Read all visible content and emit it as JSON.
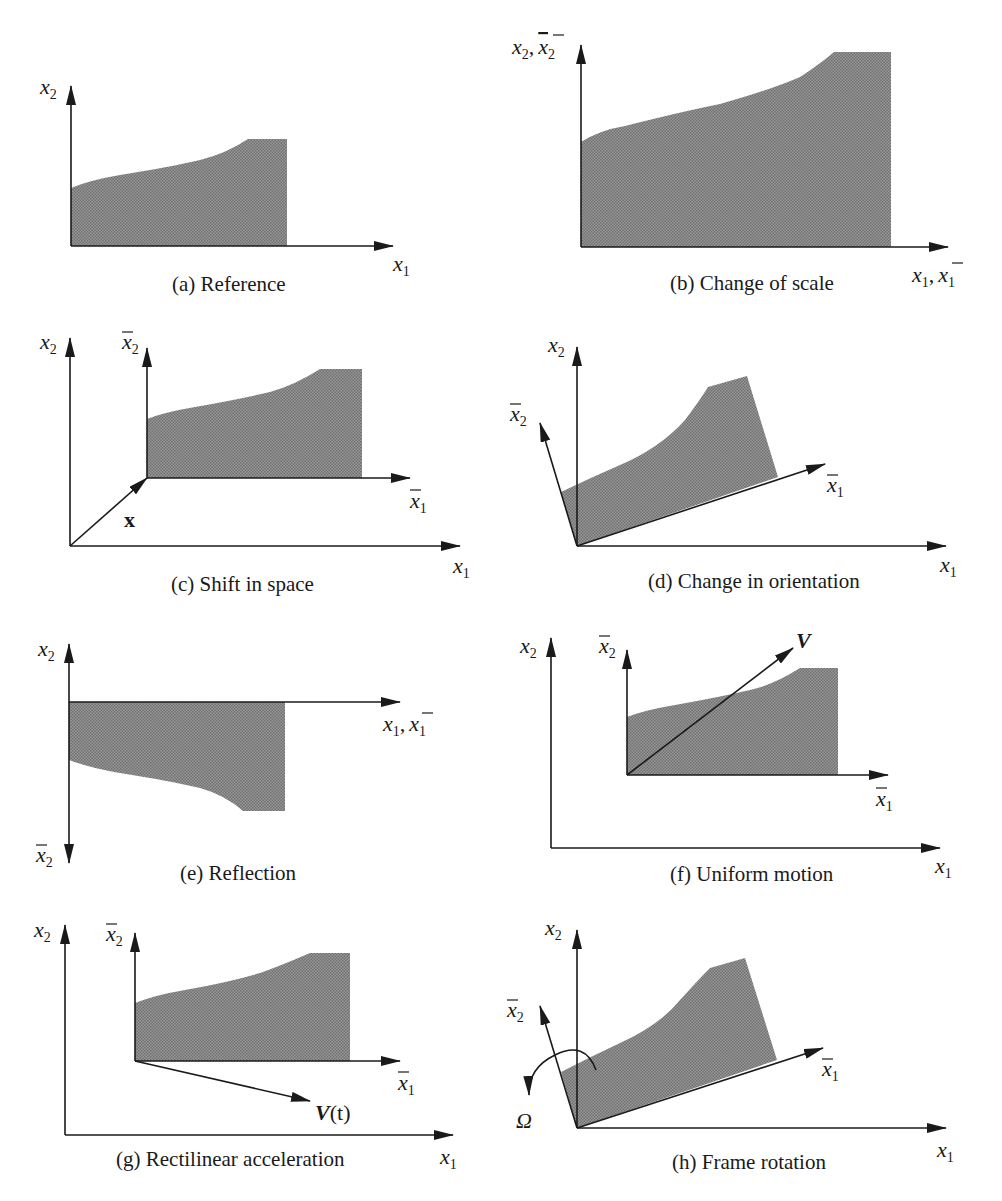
{
  "figure": {
    "colors": {
      "fill": "#8a8a8a",
      "ink": "#1a1a1a",
      "background": "#ffffff"
    },
    "panels": [
      {
        "id": "a",
        "caption": "(a) Reference",
        "labels": {
          "x2": "x",
          "x2_sub": "2",
          "x1": "x",
          "x1_sub": "1"
        }
      },
      {
        "id": "b",
        "caption": "(b) Change of scale",
        "labels": {
          "y": "x",
          "y_sub": "2",
          "y_bar": "x",
          "y_bar_sub": "2",
          "x": "x",
          "x_sub": "1",
          "x_bar": "x",
          "x_bar_sub": "1",
          "sep": ","
        }
      },
      {
        "id": "c",
        "caption": "(c) Shift in space",
        "labels": {
          "x2": "x",
          "x2_sub": "2",
          "x2bar": "x",
          "x2bar_sub": "2",
          "x1bar": "x",
          "x1bar_sub": "1",
          "x1": "x",
          "x1_sub": "1",
          "vec": "x"
        }
      },
      {
        "id": "d",
        "caption": "(d) Change in orientation",
        "labels": {
          "x2": "x",
          "x2_sub": "2",
          "x2bar": "x",
          "x2bar_sub": "2",
          "x1bar": "x",
          "x1bar_sub": "1",
          "x1": "x",
          "x1_sub": "1"
        }
      },
      {
        "id": "e",
        "caption": "(e) Reflection",
        "labels": {
          "x2": "x",
          "x2_sub": "2",
          "x2bar": "x",
          "x2bar_sub": "2",
          "x": "x",
          "x_sub": "1",
          "x_bar": "x",
          "x_bar_sub": "1",
          "sep": ","
        }
      },
      {
        "id": "f",
        "caption": "(f) Uniform motion",
        "labels": {
          "x2": "x",
          "x2_sub": "2",
          "x2bar": "x",
          "x2bar_sub": "2",
          "x1bar": "x",
          "x1bar_sub": "1",
          "x1": "x",
          "x1_sub": "1",
          "vec": "V"
        }
      },
      {
        "id": "g",
        "caption": "(g) Rectilinear acceleration",
        "labels": {
          "x2": "x",
          "x2_sub": "2",
          "x2bar": "x",
          "x2bar_sub": "2",
          "x1bar": "x",
          "x1bar_sub": "1",
          "x1": "x",
          "x1_sub": "1",
          "vec": "V",
          "vec_arg": "(t)"
        }
      },
      {
        "id": "h",
        "caption": "(h) Frame rotation",
        "labels": {
          "x2": "x",
          "x2_sub": "2",
          "x2bar": "x",
          "x2bar_sub": "2",
          "x1bar": "x",
          "x1bar_sub": "1",
          "x1": "x",
          "x1_sub": "1",
          "omega": "Ω"
        }
      }
    ]
  }
}
